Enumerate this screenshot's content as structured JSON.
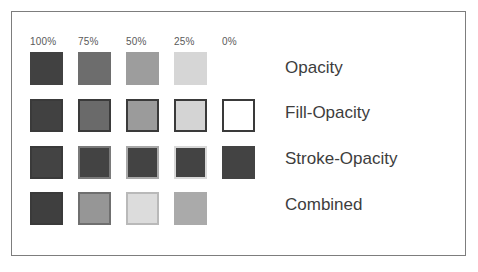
{
  "figure": {
    "background_color": "#ffffff",
    "frame_color": "#7d7d7d",
    "base_color": "#404040"
  },
  "columns": [
    {
      "label": "100%",
      "x": 30,
      "label_x": 30,
      "value": 100
    },
    {
      "label": "75%",
      "x": 78,
      "label_x": 78,
      "value": 75
    },
    {
      "label": "50%",
      "x": 126,
      "label_x": 126,
      "value": 50
    },
    {
      "label": "25%",
      "x": 174,
      "label_x": 174,
      "value": 25
    },
    {
      "label": "0%",
      "x": 222,
      "label_x": 222,
      "value": 0
    }
  ],
  "rows": [
    {
      "label": "Opacity",
      "label_y": 58,
      "y": 52,
      "cells": [
        {
          "fill": "#414141",
          "stroke": "none",
          "stroke_width": 0,
          "visible": true
        },
        {
          "fill": "#6d6d6d",
          "stroke": "none",
          "stroke_width": 0,
          "visible": true
        },
        {
          "fill": "#9d9d9d",
          "stroke": "none",
          "stroke_width": 0,
          "visible": true
        },
        {
          "fill": "#d6d6d6",
          "stroke": "none",
          "stroke_width": 0,
          "visible": true
        },
        {
          "fill": "#ffffff",
          "stroke": "none",
          "stroke_width": 0,
          "visible": false
        }
      ]
    },
    {
      "label": "Fill-Opacity",
      "label_y": 103,
      "y": 99,
      "cells": [
        {
          "fill": "#414141",
          "stroke": "#3a3a3a",
          "stroke_width": 2,
          "visible": true
        },
        {
          "fill": "#6a6a6a",
          "stroke": "#3a3a3a",
          "stroke_width": 2,
          "visible": true
        },
        {
          "fill": "#9b9b9b",
          "stroke": "#3a3a3a",
          "stroke_width": 2,
          "visible": true
        },
        {
          "fill": "#d4d4d4",
          "stroke": "#3a3a3a",
          "stroke_width": 2,
          "visible": true
        },
        {
          "fill": "#ffffff",
          "stroke": "#3a3a3a",
          "stroke_width": 2,
          "visible": true
        }
      ]
    },
    {
      "label": "Stroke-Opacity",
      "label_y": 149,
      "y": 146,
      "cells": [
        {
          "fill": "#434343",
          "stroke": "#3a3a3a",
          "stroke_width": 2,
          "visible": true
        },
        {
          "fill": "#434343",
          "stroke": "#7a7a7a",
          "stroke_width": 2,
          "visible": true
        },
        {
          "fill": "#434343",
          "stroke": "#a8a8a8",
          "stroke_width": 2,
          "visible": true
        },
        {
          "fill": "#434343",
          "stroke": "#d8d8d8",
          "stroke_width": 2,
          "visible": true
        },
        {
          "fill": "#434343",
          "stroke": "none",
          "stroke_width": 0,
          "visible": true
        }
      ]
    },
    {
      "label": "Combined",
      "label_y": 195,
      "y": 192,
      "cells": [
        {
          "fill": "#3f3f3f",
          "stroke": "#3a3a3a",
          "stroke_width": 2,
          "visible": true
        },
        {
          "fill": "#969696",
          "stroke": "#6f6f6f",
          "stroke_width": 2,
          "visible": true
        },
        {
          "fill": "#dcdcdc",
          "stroke": "#b9b9b9",
          "stroke_width": 2,
          "visible": true
        },
        {
          "fill": "#aaaaaa",
          "stroke": "none",
          "stroke_width": 0,
          "visible": true
        },
        {
          "fill": "#ffffff",
          "stroke": "none",
          "stroke_width": 0,
          "visible": false
        }
      ]
    }
  ]
}
